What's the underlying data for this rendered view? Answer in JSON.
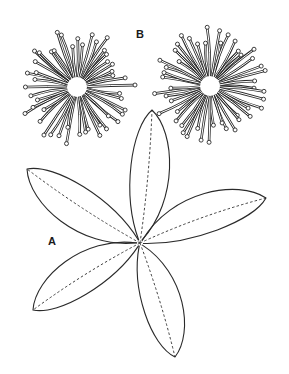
{
  "figure": {
    "labels": {
      "a": "A",
      "b": "B"
    },
    "colors": {
      "stroke": "#2a2a2a",
      "background": "#ffffff"
    },
    "panel_a": {
      "description": "Palmately compound leaf with five leaflets radiating from a common point; dashed midribs",
      "center": [
        140,
        243
      ],
      "leaflets": [
        {
          "name": "top",
          "tip": [
            152,
            110
          ],
          "width": 30,
          "bend": 6
        },
        {
          "name": "upper-left",
          "tip": [
            27,
            169
          ],
          "width": 32,
          "bend": -8
        },
        {
          "name": "right",
          "tip": [
            266,
            198
          ],
          "width": 30,
          "bend": -10
        },
        {
          "name": "lower-left",
          "tip": [
            33,
            310
          ],
          "width": 30,
          "bend": 8
        },
        {
          "name": "bottom",
          "tip": [
            175,
            357
          ],
          "width": 30,
          "bend": -6
        }
      ]
    },
    "panel_b": {
      "description": "Two pom-pom flower heads with numerous radiating stamen filaments tipped with anthers",
      "flowers": [
        {
          "name": "flower-left",
          "center": [
            77,
            87
          ],
          "filaments": 48,
          "inner": 9,
          "outer_min": 36,
          "outer_max": 58,
          "seed": 3
        },
        {
          "name": "flower-right",
          "center": [
            210,
            86
          ],
          "filaments": 48,
          "inner": 9,
          "outer_min": 36,
          "outer_max": 58,
          "seed": 11
        }
      ]
    }
  }
}
